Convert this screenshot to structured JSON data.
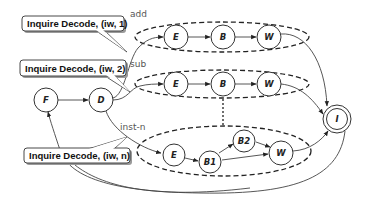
{
  "diagram": {
    "type": "state-machine",
    "nodes": {
      "F": {
        "label": "F"
      },
      "D": {
        "label": "D"
      },
      "I": {
        "label": "I"
      },
      "add_E": {
        "label": "E"
      },
      "add_B": {
        "label": "B"
      },
      "add_W": {
        "label": "W"
      },
      "sub_E": {
        "label": "E"
      },
      "sub_B": {
        "label": "B"
      },
      "sub_W": {
        "label": "W"
      },
      "n_E": {
        "label": "E"
      },
      "n_B1": {
        "label": "B1"
      },
      "n_B2": {
        "label": "B2"
      },
      "n_W": {
        "label": "W"
      }
    },
    "groups": [
      {
        "id": "add",
        "label": "add"
      },
      {
        "id": "sub",
        "label": "sub"
      },
      {
        "id": "inst-n",
        "label": "inst-n"
      }
    ],
    "callouts": [
      {
        "text": "Inquire Decode, (iw, 1)"
      },
      {
        "text": "Inquire Decode, (iw, 2)"
      },
      {
        "text": "Inquire Decode, (iw, n)"
      }
    ],
    "edges": [
      {
        "from": "F",
        "to": "D"
      },
      {
        "from": "D",
        "to": "add_E",
        "label": "add"
      },
      {
        "from": "D",
        "to": "sub_E",
        "label": "sub"
      },
      {
        "from": "D",
        "to": "n_E",
        "label": "inst-n"
      },
      {
        "from": "add_E",
        "to": "add_B"
      },
      {
        "from": "add_B",
        "to": "add_W"
      },
      {
        "from": "add_W",
        "to": "I"
      },
      {
        "from": "sub_E",
        "to": "sub_B"
      },
      {
        "from": "sub_B",
        "to": "sub_W"
      },
      {
        "from": "sub_W",
        "to": "I"
      },
      {
        "from": "n_E",
        "to": "n_B1"
      },
      {
        "from": "n_B1",
        "to": "n_B2"
      },
      {
        "from": "n_B1",
        "to": "n_W"
      },
      {
        "from": "n_B2",
        "to": "n_W"
      },
      {
        "from": "n_W",
        "to": "I"
      },
      {
        "from": "I",
        "to": "F"
      }
    ],
    "colors": {
      "stroke": "#333333",
      "dashed": "#222222",
      "callout_fill": "#ffffff",
      "callout_shadow": "#9a9a9a"
    }
  }
}
